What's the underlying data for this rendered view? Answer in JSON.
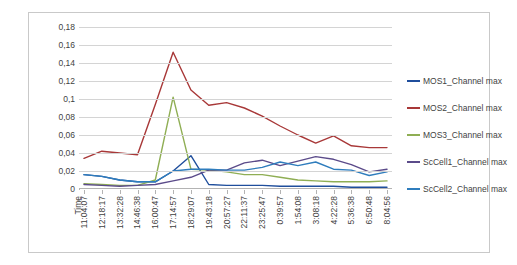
{
  "chart_data": {
    "type": "line",
    "title": "",
    "xlabel": "Time",
    "ylabel": "",
    "ylim": [
      0,
      0.18
    ],
    "yticks": [
      "0",
      "0,02",
      "0,04",
      "0,06",
      "0,08",
      "0,1",
      "0,12",
      "0,14",
      "0,16",
      "0,18"
    ],
    "ytick_values": [
      0,
      0.02,
      0.04,
      0.06,
      0.08,
      0.1,
      0.12,
      0.14,
      0.16,
      0.18
    ],
    "grid": true,
    "legend_position": "right",
    "axis_corner_label": "Time",
    "categories": [
      "11:04:07",
      "12:18:17",
      "13:32:28",
      "14:46:38",
      "16:00:47",
      "17:14:57",
      "18:29:07",
      "19:43:18",
      "20:57:27",
      "22:11:37",
      "23:25:47",
      "0:39:57",
      "1:54:08",
      "3:08:18",
      "4:22:28",
      "5:36:38",
      "6:50:48",
      "8:04:56"
    ],
    "series": [
      {
        "name": "MOS1_Channel max",
        "color": "#1f4e9c",
        "values": [
          0.016,
          0.014,
          0.01,
          0.008,
          0.008,
          0.02,
          0.037,
          0.005,
          0.004,
          0.004,
          0.004,
          0.003,
          0.003,
          0.003,
          0.003,
          0.002,
          0.002,
          0.002
        ]
      },
      {
        "name": "MOS2_Channel max",
        "color": "#a83838",
        "values": [
          0.034,
          0.042,
          0.04,
          0.038,
          0.094,
          0.152,
          0.11,
          0.093,
          0.096,
          0.09,
          0.081,
          0.07,
          0.06,
          0.051,
          0.059,
          0.048,
          0.046,
          0.046
        ]
      },
      {
        "name": "MOS3_Channel max",
        "color": "#8fae54",
        "values": [
          0.006,
          0.005,
          0.004,
          0.004,
          0.01,
          0.102,
          0.022,
          0.021,
          0.019,
          0.016,
          0.016,
          0.013,
          0.01,
          0.009,
          0.008,
          0.008,
          0.008,
          0.009
        ]
      },
      {
        "name": "ScCell1_Channel max",
        "color": "#5b4b8a",
        "values": [
          0.005,
          0.004,
          0.003,
          0.004,
          0.005,
          0.009,
          0.013,
          0.021,
          0.021,
          0.029,
          0.032,
          0.026,
          0.031,
          0.036,
          0.033,
          0.027,
          0.019,
          0.022
        ]
      },
      {
        "name": "ScCell2_Channel max",
        "color": "#2f7dbd",
        "values": [
          0.016,
          0.014,
          0.01,
          0.008,
          0.008,
          0.02,
          0.022,
          0.022,
          0.021,
          0.021,
          0.024,
          0.03,
          0.026,
          0.03,
          0.022,
          0.021,
          0.015,
          0.019
        ]
      }
    ]
  },
  "legend": {
    "items": [
      {
        "label": "MOS1_Channel max",
        "color": "#1f4e9c"
      },
      {
        "label": "MOS2_Channel max",
        "color": "#a83838"
      },
      {
        "label": "MOS3_Channel max",
        "color": "#8fae54"
      },
      {
        "label": "ScCell1_Channel max",
        "color": "#5b4b8a"
      },
      {
        "label": "ScCell2_Channel max",
        "color": "#2f7dbd"
      }
    ]
  }
}
